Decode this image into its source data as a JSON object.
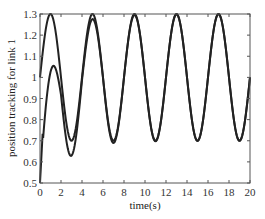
{
  "chart_data": {
    "type": "line",
    "title": "",
    "xlabel": "time(s)",
    "ylabel": "position tracking for link 1",
    "xlim": [
      0,
      20
    ],
    "ylim": [
      0.5,
      1.3
    ],
    "xticks": [
      0,
      2,
      4,
      6,
      8,
      10,
      12,
      14,
      16,
      18,
      20
    ],
    "yticks": [
      0.5,
      0.6,
      0.7,
      0.8,
      0.9,
      1,
      1.1,
      1.2,
      1.3
    ],
    "xtick_labels": [
      "0",
      "2",
      "4",
      "6",
      "8",
      "10",
      "12",
      "14",
      "16",
      "18",
      "20"
    ],
    "ytick_labels": [
      "0.5",
      "0.6",
      "0.7",
      "0.8",
      "0.9",
      "1",
      "1.1",
      "1.2",
      "1.3"
    ],
    "grid": false,
    "legend": null,
    "series": [
      {
        "name": "reference",
        "description": "1 + 0.3 sin(pi t / 2)",
        "x": [
          0,
          1,
          2,
          3,
          4,
          5,
          6,
          7,
          8,
          9,
          10,
          11,
          12,
          13,
          14,
          15,
          16,
          17,
          18,
          19,
          20
        ],
        "values": [
          1.0,
          1.3,
          1.0,
          0.7,
          1.0,
          1.3,
          1.0,
          0.7,
          1.0,
          1.3,
          1.0,
          0.7,
          1.0,
          1.3,
          1.0,
          0.7,
          1.0,
          1.3,
          1.0,
          0.7,
          1.0
        ]
      },
      {
        "name": "actual",
        "x": [
          0,
          0.3,
          1,
          2,
          3,
          4,
          5,
          6,
          7,
          8,
          9,
          10,
          11,
          12,
          13,
          14,
          15,
          16,
          17,
          18,
          19,
          20
        ],
        "values": [
          0.5,
          0.78,
          1.0,
          0.8,
          0.57,
          0.9,
          1.24,
          1.0,
          0.68,
          1.0,
          1.29,
          1.0,
          0.7,
          1.0,
          1.3,
          1.0,
          0.7,
          1.0,
          1.3,
          1.0,
          0.7,
          1.0
        ]
      }
    ],
    "line_color": "#222222"
  }
}
